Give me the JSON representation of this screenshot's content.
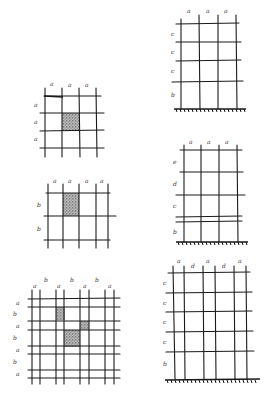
{
  "stipple_color": "#444444",
  "line_color": "#1a1a1a",
  "panels": [
    {
      "id": "panel-1",
      "position": "top-left",
      "col_labels": [
        "a",
        "a",
        "a"
      ],
      "row_labels": [
        "a",
        "a",
        "a"
      ],
      "ground": false,
      "shaded_cells": [
        [
          1,
          1
        ]
      ]
    },
    {
      "id": "panel-2",
      "position": "top-right",
      "col_labels": [
        "a",
        "a",
        "a"
      ],
      "row_labels": [
        "c",
        "c",
        "c",
        "b"
      ],
      "ground": true,
      "shaded_cells": []
    },
    {
      "id": "panel-3",
      "position": "middle-left",
      "col_labels": [
        "a",
        "a",
        "a",
        "a"
      ],
      "row_labels": [
        "b",
        "b"
      ],
      "ground": false,
      "shaded_cells": [
        [
          0,
          1
        ]
      ]
    },
    {
      "id": "panel-4",
      "position": "middle-right",
      "col_labels": [
        "a",
        "a",
        "a"
      ],
      "row_labels": [
        "e",
        "d",
        "c",
        "b"
      ],
      "ground": true,
      "shaded_cells": []
    },
    {
      "id": "panel-5",
      "position": "bottom-left",
      "col_labels": [
        "a",
        "b",
        "a",
        "b",
        "a",
        "b",
        "a"
      ],
      "row_labels": [
        "a",
        "b",
        "a",
        "b",
        "a",
        "b",
        "a"
      ],
      "ground": false,
      "shaded_cells": [
        [
          1,
          2
        ],
        [
          3,
          3
        ],
        [
          2,
          5
        ]
      ]
    },
    {
      "id": "panel-6",
      "position": "bottom-right",
      "col_labels": [
        "a",
        "d",
        "a",
        "d",
        "a"
      ],
      "row_labels": [
        "c",
        "c",
        "c",
        "c",
        "b"
      ],
      "ground": true,
      "shaded_cells": []
    }
  ]
}
